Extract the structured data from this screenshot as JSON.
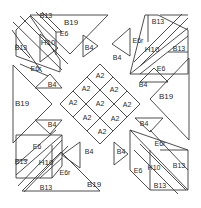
{
  "diagram": {
    "type": "quilt-block-template",
    "line_color": "#3a3a3a",
    "background": "#ffffff"
  },
  "pieces": {
    "center": {
      "a2": [
        "A2",
        "A2",
        "A2",
        "A2",
        "A2",
        "A2",
        "A2",
        "A2",
        "A2"
      ]
    },
    "side_triangles": {
      "top": "B19",
      "bottom": "B19",
      "left": "B19",
      "right": "B19"
    },
    "small_triangles": {
      "top_left": "B4",
      "top_right": "B4",
      "left_top": "B4",
      "left_bottom": "B4",
      "right_top": "B4",
      "right_bottom": "B4",
      "bottom_left": "B4",
      "bottom_right": "B4"
    },
    "corner_top_left": {
      "parallelogram": "H10",
      "triangle_a": "B13",
      "triangle_b": "B13",
      "strip_a": "E6",
      "strip_b": "E6r"
    },
    "corner_top_right": {
      "parallelogram": "H10",
      "triangle_a": "B13",
      "triangle_b": "B13",
      "strip_a": "E6r",
      "strip_b": "E6"
    },
    "corner_bottom_left": {
      "parallelogram": "H10",
      "triangle_a": "B13",
      "triangle_b": "B13",
      "strip_a": "E6",
      "strip_b": "E6r"
    },
    "corner_bottom_right": {
      "parallelogram": "H10",
      "triangle_a": "B13",
      "triangle_b": "B13",
      "strip_a": "E6r",
      "strip_b": "E6"
    }
  }
}
